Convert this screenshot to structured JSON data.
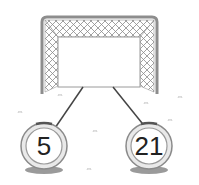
{
  "diagram": {
    "type": "goal-with-connected-balls",
    "goal": {
      "label": ""
    },
    "balls": [
      {
        "value": "5"
      },
      {
        "value": "21"
      }
    ]
  },
  "colors": {
    "frame": "#9a9a9a",
    "net": "#888888",
    "line": "#444444",
    "ball_ring": "#8a8a8a",
    "text": "#222222",
    "shadow": "#9a9a9a"
  }
}
